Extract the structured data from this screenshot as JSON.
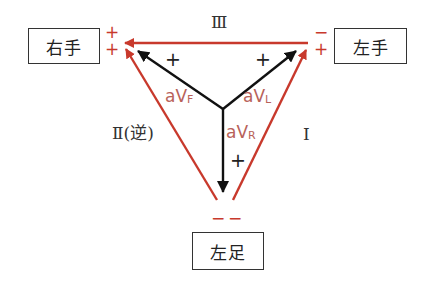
{
  "diagram": {
    "colors": {
      "limb_lead": "#c8392c",
      "augmented_lead": "#111111",
      "augmented_label": "#b8625a"
    },
    "electrodes": {
      "right_arm": "右手",
      "left_arm": "左手",
      "left_leg": "左足"
    },
    "limb_leads": {
      "lead_I": "Ⅰ",
      "lead_II": "Ⅱ(逆)",
      "lead_III": "Ⅲ"
    },
    "augmented_leads": {
      "aVF": {
        "base": "aV",
        "sub": "F"
      },
      "aVL": {
        "base": "aV",
        "sub": "L"
      },
      "aVR": {
        "base": "aV",
        "sub": "R"
      }
    },
    "polarity": {
      "right_arm_top": "+",
      "right_arm_bottom": "+",
      "left_arm_top": "−",
      "left_arm_bottom": "+",
      "left_leg_left": "−",
      "left_leg_right": "−",
      "aVF_plus": "+",
      "aVL_plus": "+",
      "aVR_plus": "+"
    }
  }
}
